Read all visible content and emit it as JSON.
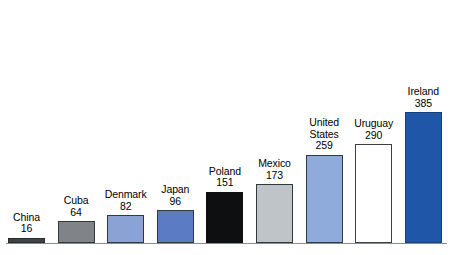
{
  "chart_data": {
    "type": "bar",
    "title": "",
    "subtitle": "",
    "xlabel": "",
    "ylabel": "",
    "ylim": [
      0,
      385
    ],
    "grid": false,
    "legend": "none",
    "axis": {
      "baseline_visible": true,
      "y_axis_visible": false,
      "x_axis_tick_labels": false
    },
    "categories": [
      "China",
      "Cuba",
      "Denmark",
      "Japan",
      "Poland",
      "Mexico",
      "United States",
      "Uruguay",
      "Ireland"
    ],
    "values": [
      16,
      64,
      82,
      96,
      151,
      173,
      259,
      290,
      385
    ],
    "bars": [
      {
        "category": "China",
        "value": 16,
        "value_text": "16",
        "color": "#3f4246",
        "outline": "#2b2e31",
        "label_lines": [
          "China",
          "16"
        ]
      },
      {
        "category": "Cuba",
        "value": 64,
        "value_text": "64",
        "color": "#808489",
        "outline": "#33383d",
        "label_lines": [
          "Cuba",
          "64"
        ]
      },
      {
        "category": "Denmark",
        "value": 82,
        "value_text": "82",
        "color": "#8aa3d4",
        "outline": "#33383d",
        "label_lines": [
          "Denmark",
          "82"
        ]
      },
      {
        "category": "Japan",
        "value": 96,
        "value_text": "96",
        "color": "#5b7cc4",
        "outline": "#33383d",
        "label_lines": [
          "Japan",
          "96"
        ]
      },
      {
        "category": "Poland",
        "value": 151,
        "value_text": "151",
        "color": "#0d0f10",
        "outline": "#0d0f10",
        "label_lines": [
          "Poland",
          "151"
        ]
      },
      {
        "category": "Mexico",
        "value": 173,
        "value_text": "173",
        "color": "#bfc4c8",
        "outline": "#33383d",
        "label_lines": [
          "Mexico",
          "173"
        ]
      },
      {
        "category": "United States",
        "value": 259,
        "value_text": "259",
        "color": "#8fabdc",
        "outline": "#33383d",
        "label_lines": [
          "United",
          "States",
          "259"
        ]
      },
      {
        "category": "Uruguay",
        "value": 290,
        "value_text": "290",
        "color": "#ffffff",
        "outline": "#3b4147",
        "label_lines": [
          "Uruguay",
          "290"
        ]
      },
      {
        "category": "Ireland",
        "value": 385,
        "value_text": "385",
        "color": "#1f56a8",
        "outline": "#17407f",
        "label_lines": [
          "Ireland",
          "385"
        ]
      }
    ]
  }
}
